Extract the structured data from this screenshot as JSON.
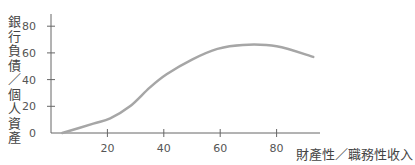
{
  "chart_data": {
    "type": "line",
    "title": "",
    "xlabel": "財產性／職務性收入",
    "ylabel": "銀行負債／個人資產",
    "xlim": [
      0,
      100
    ],
    "ylim": [
      0,
      90
    ],
    "x_ticks": [
      20,
      40,
      60,
      80
    ],
    "y_ticks": [
      0,
      20,
      40,
      60,
      80
    ],
    "grid": false,
    "legend": null,
    "series": [
      {
        "name": "curve",
        "color": "#a6a6a6",
        "x": [
          4,
          15,
          21,
          28,
          35,
          41,
          50,
          59,
          68,
          80,
          93
        ],
        "y": [
          0,
          7,
          11,
          20,
          34,
          44,
          55,
          63,
          66,
          65,
          57
        ]
      }
    ]
  },
  "colors": {
    "axis": "#666666",
    "line": "#a6a6a6",
    "text": "#555555"
  }
}
